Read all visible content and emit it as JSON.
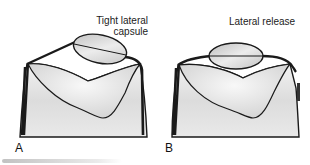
{
  "figure": {
    "panels": [
      {
        "id": "A",
        "letter": "A",
        "label_line1": "Tight lateral",
        "label_line2": "capsule"
      },
      {
        "id": "B",
        "letter": "B",
        "label_line1": "Lateral release",
        "label_line2": ""
      }
    ]
  },
  "colors": {
    "outline": "#1a1a1a",
    "bone_fill": "#d9d9d9",
    "bone_light": "#f4f4f4",
    "patella_fill": "#cfcfcf"
  }
}
